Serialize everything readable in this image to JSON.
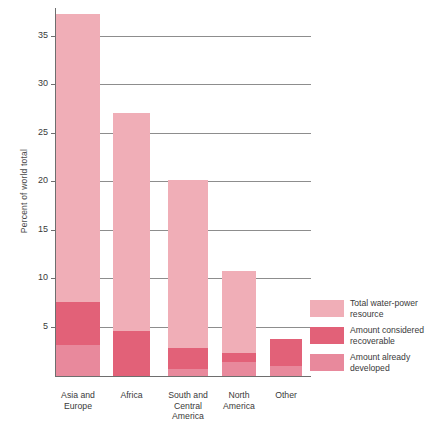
{
  "chart_data": {
    "type": "bar",
    "title": "",
    "xlabel": "",
    "ylabel": "Percent of world total",
    "ylim": [
      0,
      38
    ],
    "yticks": [
      5,
      10,
      15,
      20,
      25,
      30,
      35
    ],
    "grid": true,
    "legend_position": "right-bottom",
    "note": "Overlapping (nested) bars: each category draws total resource full height, with recoverable band and already-developed base drawn over it.",
    "categories": [
      "Asia and Europe",
      "Africa",
      "South and Central America",
      "North America",
      "Other"
    ],
    "category_label_lines": [
      [
        "Asia and",
        "Europe"
      ],
      [
        "Africa"
      ],
      [
        "South and",
        "Central",
        "America"
      ],
      [
        "North",
        "America"
      ],
      [
        "Other"
      ]
    ],
    "series": [
      {
        "name": "Total water-power resource",
        "color": "#f0aeb7",
        "values": [
          37.4,
          27.2,
          20.2,
          10.8,
          3.8
        ]
      },
      {
        "name": "Amount considered recoverable",
        "color": "#e26178",
        "values": [
          7.6,
          4.6,
          2.9,
          2.4,
          3.8
        ]
      },
      {
        "name": "Amount already developed",
        "color": "#e8899c",
        "values": [
          3.2,
          0.0,
          0.7,
          1.4,
          1.0
        ]
      }
    ]
  },
  "legend": {
    "items": [
      {
        "label": "Total water-power resource",
        "color": "#f0aeb7"
      },
      {
        "label": "Amount considered recoverable",
        "color": "#e26178"
      },
      {
        "label": "Amount already developed",
        "color": "#e8899c"
      }
    ]
  }
}
